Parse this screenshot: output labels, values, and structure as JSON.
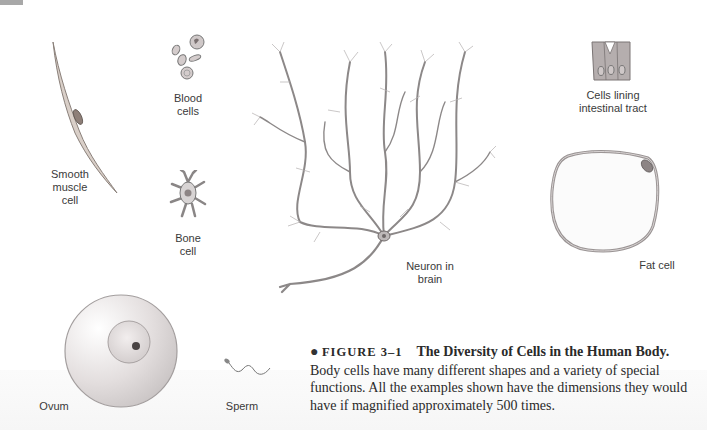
{
  "figure": {
    "number": "FIGURE 3–1",
    "title": "The Diversity of Cells in the Human Body.",
    "body": "Body cells have many different shapes and a variety of special functions. All the examples shown have the dimensions they would have if magnified approximately 500 times.",
    "bullet": "●"
  },
  "labels": {
    "smooth_muscle": "Smooth muscle cell",
    "blood": "Blood cells",
    "bone": "Bone cell",
    "neuron": "Neuron in brain",
    "intestinal": "Cells lining intestinal tract",
    "fat": "Fat cell",
    "ovum": "Ovum",
    "sperm": "Sperm"
  },
  "label_lines": {
    "smooth_muscle": [
      "Smooth",
      "muscle",
      "cell"
    ],
    "blood": [
      "Blood",
      "cells"
    ],
    "bone": [
      "Bone",
      "cell"
    ],
    "neuron": [
      "Neuron in",
      "brain"
    ],
    "intestinal": [
      "Cells lining",
      "intestinal tract"
    ]
  }
}
